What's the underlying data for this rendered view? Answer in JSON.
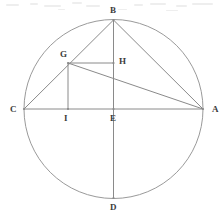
{
  "figure": {
    "type": "geometry-diagram",
    "canvas": {
      "width": 223,
      "height": 224
    },
    "colors": {
      "background": "#ffffff",
      "stroke": "#8a8a8a",
      "circle_stroke": "#9a9a9a",
      "label_text": "#3c3c3c"
    },
    "circle": {
      "cx": 113.5,
      "cy": 109,
      "r": 89.5
    },
    "points": [
      {
        "id": "A",
        "label": "A",
        "x": 203,
        "y": 109,
        "label_x": 212,
        "label_y": 105
      },
      {
        "id": "B",
        "label": "B",
        "x": 113.5,
        "y": 20,
        "label_x": 110,
        "label_y": 6
      },
      {
        "id": "C",
        "label": "C",
        "x": 24,
        "y": 109,
        "label_x": 10,
        "label_y": 105
      },
      {
        "id": "D",
        "label": "D",
        "x": 113.5,
        "y": 198,
        "label_x": 110,
        "label_y": 203
      },
      {
        "id": "E",
        "label": "E",
        "x": 113.5,
        "y": 109,
        "label_x": 110,
        "label_y": 114
      },
      {
        "id": "G",
        "label": "G",
        "x": 68,
        "y": 63,
        "label_x": 60,
        "label_y": 50
      },
      {
        "id": "H",
        "label": "H",
        "x": 113.5,
        "y": 63,
        "label_x": 119,
        "label_y": 57
      },
      {
        "id": "I",
        "label": "I",
        "x": 68,
        "y": 109,
        "label_x": 64,
        "label_y": 114
      }
    ],
    "segments": [
      {
        "name": "segment-CA",
        "from": "C",
        "to": "A"
      },
      {
        "name": "segment-BD",
        "from": "B",
        "to": "D"
      },
      {
        "name": "segment-CB",
        "from": "C",
        "to": "B"
      },
      {
        "name": "segment-BA",
        "from": "B",
        "to": "A"
      },
      {
        "name": "segment-GA",
        "from": "G",
        "to": "A"
      },
      {
        "name": "segment-GH",
        "from": "G",
        "to": "H"
      },
      {
        "name": "segment-GI",
        "from": "G",
        "to": "I"
      }
    ]
  }
}
